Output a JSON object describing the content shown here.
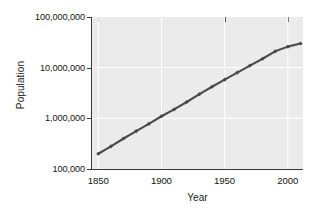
{
  "chart_data": {
    "type": "line",
    "title": "",
    "xlabel": "Year",
    "ylabel": "Population",
    "xlim": [
      1845,
      2012
    ],
    "ylim": [
      100000,
      100000000
    ],
    "yscale": "log",
    "grid": true,
    "grid_color": "#ffffff",
    "legend": "none",
    "background": "#ebebeb",
    "line_color": "#4a4a4a",
    "marker": "diamond",
    "xticks": [
      1850,
      1900,
      1950,
      2000
    ],
    "xticklabels": [
      "1850",
      "1900",
      "1950",
      "2000"
    ],
    "yticks": [
      100000,
      1000000,
      10000000,
      100000000
    ],
    "yticklabels": [
      "100,000",
      "1,000,000",
      "10,000,000",
      "100,000,000"
    ],
    "x": [
      1850,
      1860,
      1870,
      1880,
      1890,
      1900,
      1910,
      1920,
      1930,
      1940,
      1950,
      1960,
      1970,
      1980,
      1990,
      2000,
      2010
    ],
    "values": [
      200000,
      280000,
      400000,
      560000,
      780000,
      1100000,
      1500000,
      2100000,
      3000000,
      4200000,
      5800000,
      8000000,
      11000000,
      15000000,
      21000000,
      26000000,
      30000000
    ],
    "series": [
      {
        "name": "Population",
        "values": [
          200000,
          280000,
          400000,
          560000,
          780000,
          1100000,
          1500000,
          2100000,
          3000000,
          4200000,
          5800000,
          8000000,
          11000000,
          15000000,
          21000000,
          26000000,
          30000000
        ]
      }
    ]
  },
  "axes": {
    "ylabel": "Population",
    "xlabel": "Year",
    "yticklabels": [
      "100,000,000",
      "10,000,000",
      "1,000,000",
      "100,000"
    ],
    "xticklabels": [
      "1850",
      "1900",
      "1950",
      "2000"
    ]
  }
}
